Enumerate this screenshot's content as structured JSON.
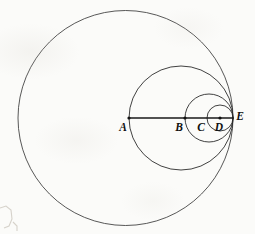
{
  "figure": {
    "background_color": "#fbfbf9",
    "stroke_color": "#2b2b2b",
    "width": 255,
    "height": 234
  },
  "chart_data": {
    "type": "diagram",
    "axis_line": {
      "label": "diameter",
      "y": 118,
      "x_start": 129,
      "x_end": 233,
      "stroke_width": 1.7
    },
    "points": [
      {
        "label": "A",
        "x": 129,
        "y": 118,
        "label_x": 123,
        "label_y": 128,
        "dot": true
      },
      {
        "label": "B",
        "x": 185,
        "y": 118,
        "label_x": 179,
        "label_y": 128,
        "dot": true
      },
      {
        "label": "C",
        "x": 207,
        "y": 118,
        "label_x": 201,
        "label_y": 128,
        "dot": false
      },
      {
        "label": "D",
        "x": 220,
        "y": 118,
        "label_x": 219,
        "label_y": 128,
        "dot": true
      },
      {
        "label": "E",
        "x": 233,
        "y": 118,
        "label_x": 240,
        "label_y": 117,
        "dot": false
      }
    ],
    "circles": [
      {
        "name": "circle-1-outer",
        "cx": 125.5,
        "cy": 118,
        "r": 107.5,
        "left_point": "",
        "right_point": "E"
      },
      {
        "name": "circle-2",
        "cx": 181,
        "cy": 118,
        "r": 52,
        "left_point": "A",
        "right_point": "E"
      },
      {
        "name": "circle-3",
        "cx": 209,
        "cy": 118,
        "r": 24,
        "left_point": "B",
        "right_point": "E"
      },
      {
        "name": "circle-4",
        "cx": 220,
        "cy": 118,
        "r": 13,
        "left_point": "C",
        "right_point": "E"
      }
    ],
    "tangency_point": "E",
    "grid": false,
    "legend": false
  }
}
